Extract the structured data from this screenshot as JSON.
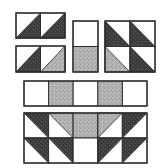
{
  "colors": {
    "background": "#ffffff",
    "dark": "#3b3b3b",
    "gray": "#b4b4b4",
    "white": "#ffffff",
    "outline": "#2e2e2e"
  },
  "units": [
    {
      "name": "top-left-half-square-units",
      "x": 16,
      "y": 13,
      "cols": 2,
      "rows": 1,
      "cell": 24.5,
      "cellH": 25,
      "cells": [
        {
          "fill": "dark",
          "shape": "tri-br"
        },
        {
          "fill": "dark",
          "shape": "tri-br"
        }
      ]
    },
    {
      "name": "second-left-half-square-units",
      "x": 16,
      "y": 46,
      "cols": 2,
      "rows": 1,
      "cell": 24.5,
      "cellH": 26,
      "cells": [
        {
          "fill": "dark",
          "shape": "tri-br"
        },
        {
          "fill": "gray",
          "shape": "tri-br"
        }
      ]
    },
    {
      "name": "center-rectangle-unit",
      "x": 73,
      "y": 21,
      "cols": 1,
      "rows": 2,
      "cell": 25,
      "cellH": 25.5,
      "cells": [
        {
          "fill": "white",
          "shape": "square"
        },
        {
          "fill": "gray",
          "shape": "square"
        }
      ]
    },
    {
      "name": "right-four-patch-unit",
      "x": 105,
      "y": 21,
      "cols": 2,
      "rows": 2,
      "cell": 25,
      "cellH": 25.5,
      "cells": [
        {
          "fill": "dark",
          "shape": "tri-bl"
        },
        {
          "fill": "dark",
          "shape": "tri-bl"
        },
        {
          "fill": "gray",
          "shape": "tri-bl"
        },
        {
          "fill": "dark",
          "shape": "tri-bl"
        }
      ]
    },
    {
      "name": "middle-strip-row",
      "x": 24,
      "y": 81,
      "cols": 5,
      "rows": 1,
      "cell": 24.6,
      "cellH": 25,
      "cells": [
        {
          "fill": "white",
          "shape": "square"
        },
        {
          "fill": "gray",
          "shape": "square"
        },
        {
          "fill": "white",
          "shape": "square"
        },
        {
          "fill": "gray",
          "shape": "square"
        },
        {
          "fill": "white",
          "shape": "square"
        }
      ]
    },
    {
      "name": "bottom-assembled-row",
      "x": 24,
      "y": 113,
      "cols": 5,
      "rows": 2,
      "cell": 24.6,
      "cellH": 25,
      "cells": [
        {
          "fill": "dark",
          "shape": "tri-tr"
        },
        {
          "fill": "gray",
          "shape": "tri-tr"
        },
        {
          "fill": "gray",
          "shape": "square"
        },
        {
          "fill": "gray",
          "shape": "tri-tl"
        },
        {
          "fill": "dark",
          "shape": "tri-tl"
        },
        {
          "fill": "dark",
          "shape": "tri-tr"
        },
        {
          "fill": "dark",
          "shape": "tri-tr"
        },
        {
          "fill": "white",
          "shape": "square"
        },
        {
          "fill": "dark",
          "shape": "tri-tl"
        },
        {
          "fill": "dark",
          "shape": "tri-tl"
        }
      ]
    }
  ]
}
